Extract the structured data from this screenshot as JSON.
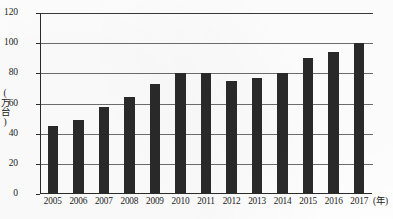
{
  "chart_data": {
    "type": "bar",
    "title": "",
    "xlabel": "(年)",
    "ylabel": "(万台)",
    "categories": [
      "2005",
      "2006",
      "2007",
      "2008",
      "2009",
      "2010",
      "2011",
      "2012",
      "2013",
      "2014",
      "2015",
      "2016",
      "2017"
    ],
    "values": [
      45,
      49,
      58,
      64,
      73,
      80,
      80,
      75,
      77,
      80,
      90,
      94,
      100
    ],
    "series": [
      {
        "name": "",
        "values": [
          45,
          49,
          58,
          64,
          73,
          80,
          80,
          75,
          77,
          80,
          90,
          94,
          100
        ]
      }
    ],
    "ylim": [
      0,
      120
    ],
    "y_ticks": [
      "0",
      "20",
      "40",
      "60",
      "80",
      "100",
      "120"
    ],
    "y_tick_values": [
      0,
      20,
      40,
      60,
      80,
      100,
      120
    ],
    "grid": true,
    "grid_axis": "y",
    "legend": "none",
    "bar_color": "#2a2a2a",
    "grid_color": "#6e6e6e",
    "axis_color": "#2b2b2b"
  }
}
